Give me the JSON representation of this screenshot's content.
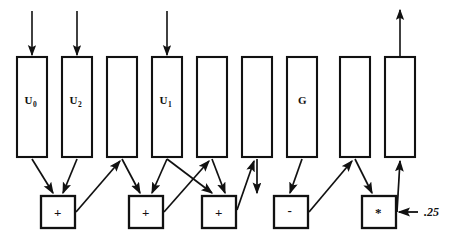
{
  "diagram": {
    "stroke_color": "#111111",
    "background_color": "#ffffff",
    "registers": [
      {
        "id": "r1",
        "label": "U",
        "subscript": "0",
        "x": 17,
        "y": 57,
        "w": 30,
        "h": 100,
        "has_input_arrow": true,
        "has_output_arrow": false
      },
      {
        "id": "r2",
        "label": "U",
        "subscript": "2",
        "x": 62,
        "y": 57,
        "w": 30,
        "h": 100,
        "has_input_arrow": true,
        "has_output_arrow": false
      },
      {
        "id": "r3",
        "label": "",
        "subscript": "",
        "x": 107,
        "y": 57,
        "w": 30,
        "h": 100,
        "has_input_arrow": false,
        "has_output_arrow": false
      },
      {
        "id": "r4",
        "label": "U",
        "subscript": "1",
        "x": 152,
        "y": 57,
        "w": 30,
        "h": 100,
        "has_input_arrow": true,
        "has_output_arrow": false
      },
      {
        "id": "r5",
        "label": "",
        "subscript": "",
        "x": 197,
        "y": 57,
        "w": 30,
        "h": 100,
        "has_input_arrow": false,
        "has_output_arrow": false
      },
      {
        "id": "r6",
        "label": "",
        "subscript": "",
        "x": 242,
        "y": 57,
        "w": 30,
        "h": 100,
        "has_input_arrow": false,
        "has_output_arrow": false
      },
      {
        "id": "r7",
        "label": "G",
        "subscript": "",
        "x": 287,
        "y": 57,
        "w": 30,
        "h": 100,
        "has_input_arrow": false,
        "has_output_arrow": false
      },
      {
        "id": "r8",
        "label": "",
        "subscript": "",
        "x": 340,
        "y": 57,
        "w": 30,
        "h": 100,
        "has_input_arrow": false,
        "has_output_arrow": false
      },
      {
        "id": "r9",
        "label": "",
        "subscript": "",
        "x": 385,
        "y": 57,
        "w": 30,
        "h": 100,
        "has_input_arrow": false,
        "has_output_arrow": true
      }
    ],
    "operators": [
      {
        "id": "op1",
        "symbol": "+",
        "x": 41,
        "y": 196,
        "w": 34,
        "h": 32
      },
      {
        "id": "op2",
        "symbol": "+",
        "x": 129,
        "y": 196,
        "w": 34,
        "h": 32
      },
      {
        "id": "op3",
        "symbol": "+",
        "x": 202,
        "y": 196,
        "w": 34,
        "h": 32
      },
      {
        "id": "op4",
        "symbol": "-",
        "x": 274,
        "y": 196,
        "w": 34,
        "h": 32
      },
      {
        "id": "op5",
        "symbol": "*",
        "x": 362,
        "y": 196,
        "w": 34,
        "h": 32
      }
    ],
    "constant_input": {
      "label": ".25",
      "target": "op5",
      "label_x": 425,
      "label_y": 216
    },
    "edges": [
      {
        "from": "r1",
        "to": "op1",
        "kind": "register-to-operator"
      },
      {
        "from": "r2",
        "to": "op1",
        "kind": "register-to-operator"
      },
      {
        "from": "op1",
        "to": "r3",
        "kind": "operator-to-register"
      },
      {
        "from": "r3",
        "to": "op2",
        "kind": "register-to-operator"
      },
      {
        "from": "r4",
        "to": "op2",
        "kind": "register-to-operator"
      },
      {
        "from": "r4",
        "to": "op3",
        "kind": "register-to-operator"
      },
      {
        "from": "op2",
        "to": "r5",
        "kind": "operator-to-register"
      },
      {
        "from": "r5",
        "to": "op3",
        "kind": "register-to-operator"
      },
      {
        "from": "r6",
        "to": "op3",
        "kind": "register-to-operator"
      },
      {
        "from": "op3",
        "to": "r6",
        "kind": "operator-to-register"
      },
      {
        "from": "r7",
        "to": "op4",
        "kind": "register-to-operator"
      },
      {
        "from": "op4",
        "to": "r8",
        "kind": "operator-to-register"
      },
      {
        "from": "r8",
        "to": "op5",
        "kind": "register-to-operator"
      },
      {
        "from": "op5",
        "to": "r9",
        "kind": "operator-to-register"
      }
    ]
  }
}
